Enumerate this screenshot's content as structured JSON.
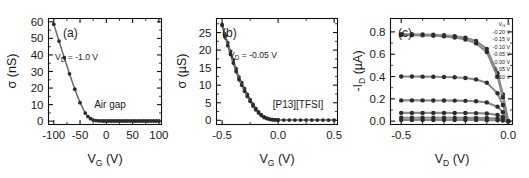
{
  "figure": {
    "title": "",
    "background": "#ffffff",
    "marker_color": "#2b2b2b",
    "line_color": "#6b6b6b"
  },
  "chart_data": [
    {
      "type": "line",
      "panel": "(a)",
      "title": "",
      "xlabel": "V",
      "xlabel_sub": "G",
      "xlabel_unit": "(V)",
      "ylabel": "σ",
      "ylabel_unit": "(nS)",
      "xlim": [
        -110,
        105
      ],
      "ylim": [
        -2,
        62
      ],
      "xticks": [
        -100,
        -50,
        0,
        50,
        100
      ],
      "xtick_labels": [
        "-100",
        "-50",
        "0",
        "50",
        "100"
      ],
      "yticks": [
        0,
        10,
        20,
        30,
        40,
        50,
        60
      ],
      "ytick_labels": [
        "0",
        "10",
        "20",
        "30",
        "40",
        "50",
        "60"
      ],
      "grid": false,
      "legend": "none",
      "annotations": [
        {
          "name": "vd-annotation",
          "text": "V",
          "sub": "D",
          "tail": " = -1.0 V"
        },
        {
          "name": "sample-annotation",
          "text": "Air gap"
        }
      ],
      "series": [
        {
          "name": "air-gap-transfer",
          "x": [
            -100,
            -90,
            -80,
            -70,
            -60,
            -50,
            -40,
            -35,
            -30,
            -25,
            -20,
            -15,
            -10,
            -5,
            0,
            5,
            10,
            15,
            20,
            25,
            30,
            35,
            40,
            45,
            50,
            55,
            60,
            65,
            70,
            75,
            80,
            85,
            90,
            95,
            100
          ],
          "y": [
            58.6,
            48.4,
            38.3,
            28.6,
            19.3,
            11.2,
            4.9,
            2.8,
            1.5,
            0.7,
            0.35,
            0.2,
            0.15,
            0.12,
            0.1,
            0.1,
            0.1,
            0.1,
            0.1,
            0.1,
            0.1,
            0.1,
            0.1,
            0.1,
            0.1,
            0.1,
            0.1,
            0.1,
            0.1,
            0.1,
            0.1,
            0.1,
            0.1,
            0.1,
            0.1
          ]
        }
      ]
    },
    {
      "type": "line",
      "panel": "(b)",
      "title": "",
      "xlabel": "V",
      "xlabel_sub": "G",
      "xlabel_unit": "(V)",
      "ylabel": "σ",
      "ylabel_unit": "(µS)",
      "xlim": [
        -0.55,
        0.53
      ],
      "ylim": [
        -1.2,
        29
      ],
      "xticks": [
        -0.5,
        0.0,
        0.5
      ],
      "xtick_labels": [
        "-0.5",
        "0.0",
        "0.5"
      ],
      "yticks": [
        0,
        5,
        10,
        15,
        20,
        25
      ],
      "ytick_labels": [
        "0",
        "5",
        "10",
        "15",
        "20",
        "25"
      ],
      "grid": false,
      "legend": "none",
      "annotations": [
        {
          "name": "vd-annotation",
          "text": "V",
          "sub": "D",
          "tail": " = -0.05 V"
        },
        {
          "name": "sample-annotation",
          "text": "[P13][TFSI]"
        }
      ],
      "series": [
        {
          "name": "ionic-liquid-transfer-forward",
          "x": [
            -0.5,
            -0.475,
            -0.45,
            -0.425,
            -0.4,
            -0.375,
            -0.35,
            -0.325,
            -0.3,
            -0.275,
            -0.25,
            -0.225,
            -0.2,
            -0.175,
            -0.15,
            -0.125,
            -0.1,
            -0.075,
            -0.05,
            -0.025,
            0.0,
            0.05,
            0.1,
            0.15,
            0.2,
            0.25,
            0.3,
            0.35,
            0.4,
            0.45,
            0.5
          ],
          "y": [
            27.3,
            24.6,
            22.1,
            19.6,
            17.2,
            14.7,
            12.3,
            10.7,
            9.0,
            7.4,
            5.9,
            4.6,
            3.4,
            2.4,
            1.6,
            1.0,
            0.6,
            0.35,
            0.2,
            0.12,
            0.08,
            0.05,
            0.05,
            0.05,
            0.05,
            0.05,
            0.05,
            0.05,
            0.05,
            0.05,
            0.05
          ]
        },
        {
          "name": "ionic-liquid-transfer-reverse",
          "x": [
            -0.5,
            -0.475,
            -0.45,
            -0.425,
            -0.4,
            -0.375,
            -0.35,
            -0.325,
            -0.3,
            -0.275,
            -0.25,
            -0.225,
            -0.2,
            -0.175,
            -0.15,
            -0.125,
            -0.1,
            -0.075,
            -0.05,
            -0.025,
            0.0
          ],
          "y": [
            27.0,
            24.0,
            21.3,
            18.8,
            16.3,
            13.9,
            11.6,
            10.0,
            8.3,
            6.8,
            5.4,
            4.1,
            3.0,
            2.1,
            1.35,
            0.8,
            0.45,
            0.25,
            0.15,
            0.1,
            0.06
          ]
        }
      ]
    },
    {
      "type": "line",
      "panel": "(c)",
      "title": "",
      "xlabel": "V",
      "xlabel_sub": "D",
      "xlabel_unit": "(V)",
      "ylabel": "-I",
      "ylabel_sub": "D",
      "ylabel_unit": "(µA)",
      "xlim": [
        -0.55,
        0.02
      ],
      "ylim": [
        -0.03,
        0.92
      ],
      "xticks": [
        -0.5,
        0.0
      ],
      "xtick_labels": [
        "-0.5",
        "0.0"
      ],
      "yticks": [
        0.0,
        0.2,
        0.4,
        0.6,
        0.8
      ],
      "ytick_labels": [
        "0.0",
        "0.2",
        "0.4",
        "0.6",
        "0.8"
      ],
      "grid": false,
      "legend": "upper-right-inside",
      "legend_header": "V",
      "legend_header_sub": "G",
      "legend_header_tail": " =",
      "legend_entries": [
        "-0.20 V",
        "-0.15 V",
        "-0.10 V",
        "-0.05 V",
        "0.00 V",
        "0.05 V",
        "0.10 V"
      ],
      "annotations": [],
      "series": [
        {
          "name": "output-vg--0.20",
          "label": "-0.20 V",
          "x": [
            -0.5,
            -0.45,
            -0.4,
            -0.35,
            -0.3,
            -0.25,
            -0.2,
            -0.15,
            -0.1,
            -0.05,
            -0.025,
            0.0
          ],
          "y": [
            0.78,
            0.779,
            0.777,
            0.774,
            0.77,
            0.762,
            0.748,
            0.718,
            0.648,
            0.43,
            0.24,
            0.0
          ]
        },
        {
          "name": "output-vg--0.15",
          "label": "-0.15 V",
          "x": [
            -0.5,
            -0.45,
            -0.4,
            -0.35,
            -0.3,
            -0.25,
            -0.2,
            -0.15,
            -0.1,
            -0.05,
            -0.025,
            0.0
          ],
          "y": [
            0.772,
            0.771,
            0.769,
            0.765,
            0.76,
            0.75,
            0.732,
            0.697,
            0.62,
            0.4,
            0.215,
            0.0
          ]
        },
        {
          "name": "output-vg--0.10",
          "label": "-0.10 V",
          "x": [
            -0.5,
            -0.45,
            -0.4,
            -0.35,
            -0.3,
            -0.25,
            -0.2,
            -0.15,
            -0.1,
            -0.05,
            -0.025,
            0.0
          ],
          "y": [
            0.4,
            0.4,
            0.399,
            0.398,
            0.396,
            0.393,
            0.387,
            0.374,
            0.345,
            0.25,
            0.145,
            0.0
          ]
        },
        {
          "name": "output-vg--0.05",
          "label": "-0.05 V",
          "x": [
            -0.5,
            -0.45,
            -0.4,
            -0.35,
            -0.3,
            -0.25,
            -0.2,
            -0.15,
            -0.1,
            -0.05,
            -0.025,
            0.0
          ],
          "y": [
            0.186,
            0.186,
            0.186,
            0.185,
            0.185,
            0.184,
            0.182,
            0.178,
            0.168,
            0.13,
            0.08,
            0.0
          ]
        },
        {
          "name": "output-vg-0.00",
          "label": "0.00 V",
          "x": [
            -0.5,
            -0.45,
            -0.4,
            -0.35,
            -0.3,
            -0.25,
            -0.2,
            -0.15,
            -0.1,
            -0.05,
            -0.025,
            0.0
          ],
          "y": [
            0.074,
            0.074,
            0.074,
            0.074,
            0.074,
            0.073,
            0.073,
            0.072,
            0.069,
            0.056,
            0.036,
            0.0
          ]
        },
        {
          "name": "output-vg-0.05",
          "label": "0.05 V",
          "x": [
            -0.5,
            -0.45,
            -0.4,
            -0.35,
            -0.3,
            -0.25,
            -0.2,
            -0.15,
            -0.1,
            -0.05,
            -0.025,
            0.0
          ],
          "y": [
            0.03,
            0.03,
            0.03,
            0.03,
            0.03,
            0.03,
            0.029,
            0.029,
            0.028,
            0.023,
            0.015,
            0.0
          ]
        },
        {
          "name": "output-vg-0.10",
          "label": "0.10 V",
          "x": [
            -0.5,
            -0.45,
            -0.4,
            -0.35,
            -0.3,
            -0.25,
            -0.2,
            -0.15,
            -0.1,
            -0.05,
            -0.025,
            0.0
          ],
          "y": [
            0.01,
            0.01,
            0.01,
            0.01,
            0.01,
            0.01,
            0.01,
            0.01,
            0.009,
            0.008,
            0.005,
            0.0
          ]
        }
      ]
    }
  ]
}
